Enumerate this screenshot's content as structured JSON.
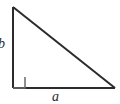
{
  "figure": {
    "background_color": "#ffffff",
    "stroke_color": "#2b2b2b",
    "labels": {
      "vertical_leg": "b",
      "horizontal_leg": "a"
    },
    "geometry": {
      "apex": [
        13,
        7
      ],
      "right_angle_vertex": [
        13,
        88
      ],
      "far_vertex": [
        115,
        88
      ],
      "right_angle_marker_size": 12
    }
  }
}
